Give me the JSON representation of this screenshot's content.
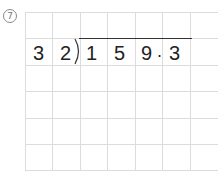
{
  "problem": {
    "number_label": "7",
    "divisor": [
      "3",
      "2"
    ],
    "dividend": [
      "1",
      "5",
      "9",
      "3"
    ],
    "decimal_point": ".",
    "expression": "159.3 ÷ 32"
  },
  "grid": {
    "columns": 7,
    "rows": 6,
    "line_color": "#dcdcdc"
  }
}
